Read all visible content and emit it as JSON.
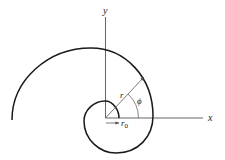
{
  "diagram": {
    "type": "polar-spiral",
    "labels": {
      "x_axis": "x",
      "y_axis": "y",
      "radius": "r",
      "angle": "ϕ",
      "initial_radius_base": "r",
      "initial_radius_sub": "0"
    },
    "colors": {
      "curve": "#1a1a1a",
      "axes": "#555555",
      "arrow": "#555555",
      "text": "#222222",
      "background": "#ffffff"
    }
  }
}
